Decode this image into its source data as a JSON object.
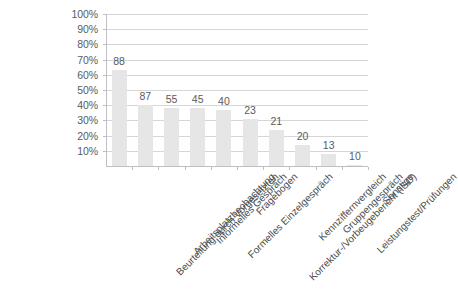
{
  "chart_data": {
    "type": "bar",
    "title": "",
    "subtitle": "",
    "xlabel": "",
    "ylabel": "",
    "ylim": [
      0,
      100
    ],
    "grid": true,
    "legend": false,
    "orientation": "vertical",
    "bar_color": "#e6e6e6",
    "gridline_color": "#d6d6d6",
    "axis_color": "#bfbfbf",
    "text_color": "#5b5b5b",
    "background_color": "#ffffff",
    "y_tick_labels": [
      "100%",
      "90%",
      "80%",
      "70%",
      "60%",
      "50%",
      "40%",
      "30%",
      "20%",
      "10%"
    ],
    "y_tick_values": [
      100,
      90,
      80,
      70,
      60,
      50,
      40,
      30,
      20,
      10
    ],
    "categories": [
      "Beurteilung durch Vorgesetzten",
      "Arbeitsplatzbeobachtung",
      "Informelles Gespräch",
      "Formelles Einzelgespräch",
      "Fragebogen",
      "Korrektur-/Vorbeugebericht (ISO)",
      "Kennziffernvergleich",
      "Gruppengespräch",
      "Leistungstest/Prüfungen",
      "Sonstige"
    ],
    "values": [
      63,
      40,
      38,
      38,
      37,
      31,
      24,
      14,
      8,
      0.5
    ],
    "data_labels": [
      "88",
      "87",
      "55",
      "45",
      "40",
      "23",
      "21",
      "20",
      "13",
      "10"
    ]
  }
}
